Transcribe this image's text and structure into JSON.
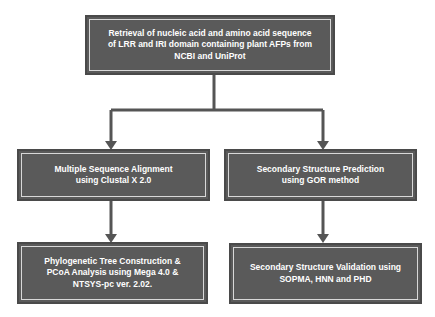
{
  "diagram": {
    "type": "flowchart",
    "colors": {
      "box_fill": "#5a5a5a",
      "box_border": "#4a4a4a",
      "inner_border": "#d8d8d8",
      "text": "#ffffff",
      "connector": "#555555"
    },
    "nodes": {
      "retrieval": {
        "label": "Retrieval of nucleic acid and amino acid sequence of LRR and IRI domain containing plant AFPs from NCBI and UniProt"
      },
      "msa": {
        "label": "Multiple Sequence Alignment using Clustal X 2.0"
      },
      "ssp": {
        "label": "Secondary Structure Prediction using GOR method"
      },
      "phylo": {
        "label": "Phylogenetic Tree Construction & PCoA Analysis using Mega 4.0 & NTSYS-pc ver. 2.02."
      },
      "ssv": {
        "label": "Secondary Structure Validation using SOPMA, HNN and PHD"
      }
    },
    "edges": [
      {
        "from": "retrieval",
        "to": "msa"
      },
      {
        "from": "retrieval",
        "to": "ssp"
      },
      {
        "from": "msa",
        "to": "phylo"
      },
      {
        "from": "ssp",
        "to": "ssv"
      }
    ]
  }
}
